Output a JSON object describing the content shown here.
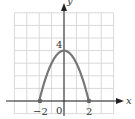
{
  "chart_data": {
    "type": "line",
    "title": "",
    "function": "y = 4 - x^2",
    "xlabel": "x",
    "ylabel": "y",
    "xlim": [
      -4,
      4
    ],
    "ylim": [
      -1,
      7
    ],
    "grid": true,
    "x_tick_labels": [
      "-2",
      "0",
      "2"
    ],
    "y_tick_labels": [
      "4"
    ],
    "series": [
      {
        "name": "parabola",
        "x": [
          -2,
          -1.5,
          -1,
          -0.5,
          0,
          0.5,
          1,
          1.5,
          2
        ],
        "y": [
          0,
          1.75,
          3,
          3.75,
          4,
          3.75,
          3,
          1.75,
          0
        ],
        "endpoints": [
          [
            -2,
            0
          ],
          [
            2,
            0
          ]
        ],
        "color": "#777777"
      }
    ]
  },
  "labels": {
    "x_axis": "x",
    "y_axis": "y",
    "tick_neg2": "−2",
    "tick_0": "0",
    "tick_2": "2",
    "tick_y4": "4"
  },
  "colors": {
    "grid": "#cfcfcf",
    "axis": "#222222",
    "curve": "#777777",
    "text": "#333333"
  }
}
